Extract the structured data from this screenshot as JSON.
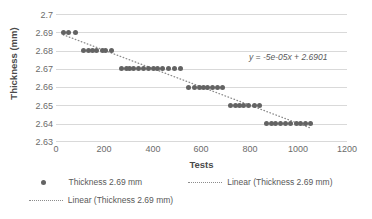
{
  "chart_data": {
    "type": "scatter",
    "title": "",
    "xlabel": "Tests",
    "ylabel": "Thickness (mm)",
    "xlim": [
      0,
      1200
    ],
    "ylim": [
      2.63,
      2.7
    ],
    "xticks": [
      0,
      200,
      400,
      600,
      800,
      1000,
      1200
    ],
    "yticks": [
      "2.63",
      "2.64",
      "2.65",
      "2.66",
      "2.67",
      "2.68",
      "2.69",
      "2.7"
    ],
    "grid": true,
    "legend_position": "bottom",
    "annotations": [
      {
        "text": "y = -5e-05x + 2.6901",
        "x": 820,
        "y": 2.678
      }
    ],
    "series": [
      {
        "name": "Thickness 2.69 mm",
        "type": "scatter",
        "marker": "circle",
        "color": "#636363",
        "points": [
          [
            30,
            2.69
          ],
          [
            50,
            2.69
          ],
          [
            80,
            2.69
          ],
          [
            115,
            2.68
          ],
          [
            135,
            2.68
          ],
          [
            150,
            2.68
          ],
          [
            165,
            2.68
          ],
          [
            190,
            2.68
          ],
          [
            205,
            2.68
          ],
          [
            230,
            2.68
          ],
          [
            270,
            2.67
          ],
          [
            290,
            2.67
          ],
          [
            305,
            2.67
          ],
          [
            320,
            2.67
          ],
          [
            340,
            2.67
          ],
          [
            360,
            2.67
          ],
          [
            380,
            2.67
          ],
          [
            400,
            2.67
          ],
          [
            420,
            2.67
          ],
          [
            440,
            2.67
          ],
          [
            465,
            2.67
          ],
          [
            490,
            2.67
          ],
          [
            515,
            2.67
          ],
          [
            545,
            2.66
          ],
          [
            570,
            2.66
          ],
          [
            590,
            2.66
          ],
          [
            610,
            2.66
          ],
          [
            625,
            2.66
          ],
          [
            645,
            2.66
          ],
          [
            665,
            2.66
          ],
          [
            685,
            2.66
          ],
          [
            720,
            2.65
          ],
          [
            740,
            2.65
          ],
          [
            755,
            2.65
          ],
          [
            775,
            2.65
          ],
          [
            795,
            2.65
          ],
          [
            820,
            2.65
          ],
          [
            840,
            2.65
          ],
          [
            870,
            2.64
          ],
          [
            890,
            2.64
          ],
          [
            905,
            2.64
          ],
          [
            925,
            2.64
          ],
          [
            945,
            2.64
          ],
          [
            965,
            2.64
          ],
          [
            990,
            2.64
          ],
          [
            1010,
            2.64
          ],
          [
            1030,
            2.64
          ],
          [
            1050,
            2.64
          ]
        ]
      },
      {
        "name": "Linear (Thickness 2.69 mm)",
        "type": "line",
        "style": "dotted",
        "color": "#8c8c8c",
        "slope": -5e-05,
        "intercept": 2.6901,
        "x_start": 30,
        "x_end": 1050
      },
      {
        "name": "Linear (Thickness 2.69 mm)",
        "type": "line",
        "style": "dotted",
        "color": "#8c8c8c",
        "slope": -5e-05,
        "intercept": 2.6901,
        "x_start": 30,
        "x_end": 1050
      }
    ]
  },
  "axes": {
    "x_title": "Tests",
    "y_title": "Thickness (mm)",
    "x_tick_labels": [
      "0",
      "200",
      "400",
      "600",
      "800",
      "1000",
      "1200"
    ],
    "y_tick_labels": [
      "2.7",
      "2.69",
      "2.68",
      "2.67",
      "2.66",
      "2.65",
      "2.64",
      "2.63"
    ]
  },
  "annotation": {
    "equation": "y = -5e-05x + 2.6901"
  },
  "legend": {
    "items": [
      {
        "label": "Thickness 2.69 mm",
        "marker": "dot"
      },
      {
        "label": "Linear (Thickness 2.69 mm)",
        "marker": "dotted-line"
      },
      {
        "label": "Linear (Thickness 2.69 mm)",
        "marker": "dotted-line"
      }
    ]
  },
  "colors": {
    "marker": "#636363",
    "trendline": "#8c8c8c",
    "gridline": "#d9d9d9",
    "text": "#595959"
  }
}
